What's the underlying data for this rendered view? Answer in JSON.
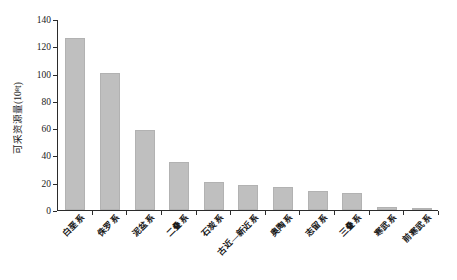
{
  "chart_data": {
    "type": "bar",
    "title": "",
    "xlabel": "",
    "ylabel": "可采资源量(10⁸t)",
    "ylim": [
      0,
      140
    ],
    "ytick_step": 20,
    "yticks": [
      0,
      20,
      40,
      60,
      80,
      100,
      120,
      140
    ],
    "grid": false,
    "legend": null,
    "bar_color": "#bfbfbf",
    "axis_color": "#2b2b2b",
    "categories": [
      "白垩系",
      "侏罗系",
      "泥盆系",
      "二叠系",
      "石炭系",
      "古近—新近系",
      "奥陶系",
      "志留系",
      "三叠系",
      "寒武系",
      "前寒武系"
    ],
    "values": [
      127,
      101,
      59,
      35,
      20,
      18,
      17,
      14,
      12,
      2,
      1
    ]
  }
}
